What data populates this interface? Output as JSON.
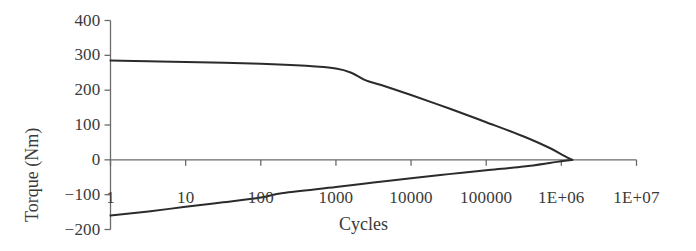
{
  "chart_data": {
    "type": "line",
    "title": "",
    "xlabel": "Cycles",
    "ylabel": "Torque (Nm)",
    "xscale": "log",
    "xlim": [
      1,
      10000000
    ],
    "ylim": [
      -200,
      400
    ],
    "grid": false,
    "legend": null,
    "xticks": [
      "1",
      "10",
      "100",
      "1000",
      "10000",
      "100000",
      "1E+06",
      "1E+07"
    ],
    "xtick_values": [
      1,
      10,
      100,
      1000,
      10000,
      100000,
      1000000,
      10000000
    ],
    "yticks": [
      "400",
      "300",
      "200",
      "100",
      "0",
      "-100",
      "-200"
    ],
    "ytick_values": [
      400,
      300,
      200,
      100,
      0,
      -100,
      -200
    ],
    "series": [
      {
        "name": "Upper torque envelope",
        "color": "#2b2b2b",
        "points": [
          [
            1,
            285
          ],
          [
            3.2,
            283
          ],
          [
            10,
            281
          ],
          [
            100,
            276
          ],
          [
            400,
            270
          ],
          [
            1000,
            262
          ],
          [
            1600,
            250
          ],
          [
            2500,
            228
          ],
          [
            4000,
            215
          ],
          [
            10000,
            186
          ],
          [
            31600,
            148
          ],
          [
            100000,
            108
          ],
          [
            316000,
            67
          ],
          [
            700000,
            34
          ],
          [
            1000000,
            16
          ],
          [
            1250000,
            5
          ],
          [
            1400000,
            0
          ]
        ]
      },
      {
        "name": "Lower torque envelope",
        "color": "#2b2b2b",
        "points": [
          [
            1,
            -160
          ],
          [
            3.2,
            -148
          ],
          [
            10,
            -135
          ],
          [
            31.6,
            -122
          ],
          [
            100,
            -108
          ],
          [
            200,
            -95
          ],
          [
            1000,
            -78
          ],
          [
            3160,
            -65
          ],
          [
            10000,
            -53
          ],
          [
            31600,
            -41
          ],
          [
            100000,
            -30
          ],
          [
            316000,
            -19
          ],
          [
            700000,
            -9
          ],
          [
            1000000,
            -4
          ],
          [
            1400000,
            0
          ]
        ]
      }
    ],
    "zero_line": 0,
    "axis_color": "#6b6b6b",
    "curve_color": "#2b2b2b"
  },
  "axis_labels": {
    "y_axis_title": "Torque (Nm)",
    "x_axis_title": "Cycles"
  }
}
